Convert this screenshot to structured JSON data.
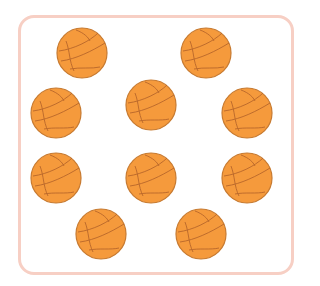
{
  "scene": {
    "description": "Counting picture of basketballs inside a rounded frame",
    "frame_color": "#f7cfc4",
    "ball_fill": "#f59a3c",
    "ball_line": "#b8662a",
    "ball_count": 10,
    "balls": [
      {
        "cx": 82,
        "cy": 53
      },
      {
        "cx": 206,
        "cy": 53
      },
      {
        "cx": 56,
        "cy": 113
      },
      {
        "cx": 151,
        "cy": 105
      },
      {
        "cx": 247,
        "cy": 113
      },
      {
        "cx": 56,
        "cy": 178
      },
      {
        "cx": 151,
        "cy": 178
      },
      {
        "cx": 247,
        "cy": 178
      },
      {
        "cx": 101,
        "cy": 234
      },
      {
        "cx": 201,
        "cy": 234
      }
    ]
  }
}
